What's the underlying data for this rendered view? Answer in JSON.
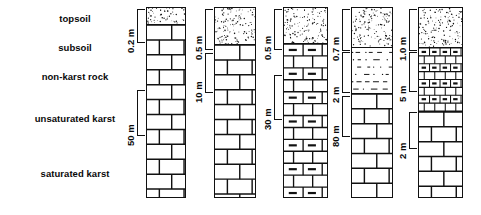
{
  "figure": {
    "width": 481,
    "height": 215,
    "background_color": "#ffffff",
    "line_color": "#111111"
  },
  "legend": {
    "items": [
      {
        "label": "topsoil",
        "x": 75,
        "y": 13
      },
      {
        "label": "subsoil",
        "x": 75,
        "y": 42
      },
      {
        "label": "non-karst rock",
        "x": 75,
        "y": 71
      },
      {
        "label": "unsaturated karst",
        "x": 75,
        "y": 113
      },
      {
        "label": "saturated karst",
        "x": 75,
        "y": 168
      }
    ]
  },
  "columns": [
    {
      "id": "column-1",
      "x": 146,
      "y": 7,
      "width": 40,
      "height": 191,
      "layers": [
        {
          "name": "topsoil",
          "pattern": "stipple",
          "top": 0,
          "height": 16
        },
        {
          "name": "unsaturated-karst",
          "pattern": "brick-large",
          "top": 16,
          "height": 175
        }
      ],
      "annotations": [
        {
          "text": "0.2 m",
          "target": "topsoil",
          "bar_top": 2,
          "bar_height": 33
        },
        {
          "text": "50 m",
          "target": "unsaturated-karst",
          "bar_top": 83,
          "bar_height": 45
        }
      ]
    },
    {
      "id": "column-2",
      "x": 214,
      "y": 7,
      "width": 42,
      "height": 191,
      "layers": [
        {
          "name": "topsoil",
          "pattern": "stipple",
          "top": 0,
          "height": 36
        },
        {
          "name": "unsaturated-karst",
          "pattern": "brick-large",
          "top": 36,
          "height": 155
        }
      ],
      "annotations": [
        {
          "text": "0.5 m",
          "target": "topsoil",
          "bar_top": 2,
          "bar_height": 40
        },
        {
          "text": "10 m",
          "target": "unsaturated-karst",
          "bar_top": 46,
          "bar_height": 39
        }
      ]
    },
    {
      "id": "column-3",
      "x": 283,
      "y": 7,
      "width": 45,
      "height": 191,
      "layers": [
        {
          "name": "topsoil",
          "pattern": "stipple",
          "top": 0,
          "height": 35
        },
        {
          "name": "unsaturated-karst",
          "pattern": "brick-dashed",
          "top": 35,
          "height": 156
        }
      ],
      "annotations": [
        {
          "text": "0.5 m",
          "target": "topsoil",
          "bar_top": 2,
          "bar_height": 40
        },
        {
          "text": "30 m",
          "target": "unsaturated-karst",
          "bar_top": 68,
          "bar_height": 44
        }
      ]
    },
    {
      "id": "column-4",
      "x": 351,
      "y": 7,
      "width": 42,
      "height": 191,
      "layers": [
        {
          "name": "topsoil",
          "pattern": "stipple",
          "top": 0,
          "height": 39
        },
        {
          "name": "subsoil",
          "pattern": "dash-dot",
          "top": 39,
          "height": 46
        },
        {
          "name": "unsaturated-karst",
          "pattern": "brick-large",
          "top": 85,
          "height": 106
        }
      ],
      "annotations": [
        {
          "text": "0.7 m",
          "target": "topsoil",
          "bar_top": 2,
          "bar_height": 41
        },
        {
          "text": "2 m",
          "target": "subsoil",
          "bar_top": 45,
          "bar_height": 40
        },
        {
          "text": "80 m",
          "target": "unsaturated-karst",
          "bar_top": 89,
          "bar_height": 40
        }
      ]
    },
    {
      "id": "column-5",
      "x": 418,
      "y": 7,
      "width": 45,
      "height": 191,
      "layers": [
        {
          "name": "topsoil",
          "pattern": "stipple",
          "top": 0,
          "height": 39
        },
        {
          "name": "non-karst-rock",
          "pattern": "brick-small",
          "top": 39,
          "height": 64
        },
        {
          "name": "unsaturated-karst",
          "pattern": "brick-large",
          "top": 103,
          "height": 88
        }
      ],
      "annotations": [
        {
          "text": "1.0 m",
          "target": "topsoil",
          "bar_top": 2,
          "bar_height": 41
        },
        {
          "text": "5 m",
          "target": "non-karst-rock",
          "bar_top": 45,
          "bar_height": 39
        },
        {
          "text": "2 m",
          "target": "unsaturated-karst",
          "bar_top": 105,
          "bar_height": 36
        }
      ]
    }
  ]
}
